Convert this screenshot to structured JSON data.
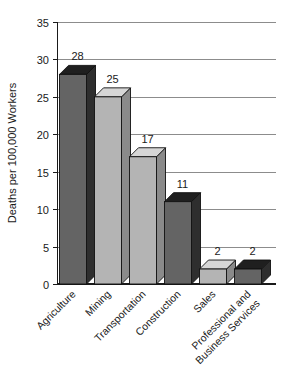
{
  "chart_data": {
    "type": "bar",
    "title": "",
    "subtitle": "",
    "xlabel": "",
    "ylabel": "Deaths per 100,000 Workers",
    "ylim": [
      0,
      35
    ],
    "yticks": [
      0,
      5,
      10,
      15,
      20,
      25,
      30,
      35
    ],
    "ytick_labels": [
      "0",
      "5",
      "10",
      "15",
      "20",
      "25",
      "30",
      "35"
    ],
    "grid": "horizontal",
    "legend": "none",
    "categories": [
      "Agriculture",
      "Mining",
      "Transportation",
      "Construction",
      "Sales",
      "Professional and Business Services"
    ],
    "category_lines": [
      [
        "Agriculture"
      ],
      [
        "Mining"
      ],
      [
        "Transportation"
      ],
      [
        "Construction"
      ],
      [
        "Sales"
      ],
      [
        "Professional and",
        "Business Services"
      ]
    ],
    "values": [
      28,
      25,
      17,
      11,
      2,
      2
    ],
    "value_labels": [
      "28",
      "25",
      "17",
      "11",
      "2",
      "2"
    ],
    "bar_shading": [
      "dark",
      "light",
      "light",
      "dark",
      "light",
      "dark"
    ],
    "style": "3d-bars"
  },
  "colors": {
    "bar_dark_face": "#646464",
    "bar_dark_side": "#2e2e2e",
    "bar_dark_top": "#1f1f1f",
    "bar_light_face": "#b4b4b4",
    "bar_light_side": "#8a8a8a",
    "bar_light_top": "#d6d6d6",
    "gridline": "#8c8c8c",
    "axis": "#1a1a1a",
    "text": "#1a1a1a",
    "background": "#ffffff"
  },
  "axis": {
    "y_title": "Deaths per 100,000 Workers"
  }
}
